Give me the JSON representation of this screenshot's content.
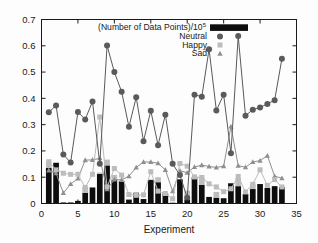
{
  "chart_data": {
    "type": "line",
    "title": "",
    "subtitle": "",
    "xlabel": "Experiment",
    "ylabel": "",
    "xlim": [
      0,
      35
    ],
    "ylim": [
      0,
      0.7
    ],
    "xticks": [
      0,
      5,
      10,
      15,
      20,
      25,
      30,
      35
    ],
    "xtick_labels": [
      "0",
      "5",
      "10",
      "15",
      "20",
      "25",
      "30",
      "35"
    ],
    "yticks": [
      0,
      0.1,
      0.2,
      0.3,
      0.4,
      0.5,
      0.6,
      0.7
    ],
    "ytick_labels": [
      "0",
      "0.1",
      "0.2",
      "0.3",
      "0.4",
      "0.5",
      "0.6",
      "0.7"
    ],
    "grid": false,
    "legend_position": "top-center",
    "x": [
      1,
      2,
      3,
      4,
      5,
      6,
      7,
      8,
      9,
      10,
      11,
      12,
      13,
      14,
      15,
      16,
      17,
      18,
      19,
      20,
      21,
      22,
      23,
      24,
      25,
      26,
      27,
      28,
      29,
      30,
      31,
      32,
      33
    ],
    "series": [
      {
        "name": "(Number of Data Points)/10",
        "name_exponent": "5",
        "type": "bar",
        "marker": "filled-rectangle",
        "color": "#0d0d0d",
        "values": [
          0.135,
          0.155,
          0.004,
          0.004,
          0.01,
          0.04,
          0.061,
          0.113,
          0.145,
          0.09,
          0.086,
          0.015,
          0.041,
          0.017,
          0.09,
          0.081,
          0.038,
          0.003,
          0.092,
          0.016,
          0.1,
          0.071,
          0.025,
          0.022,
          0.02,
          0.077,
          0.066,
          0.036,
          0.055,
          0.074,
          0.059,
          0.066,
          0.062
        ]
      },
      {
        "name": "Neutral",
        "type": "line-marker",
        "marker": "circle",
        "color": "#5a5a5a",
        "values": [
          0.347,
          0.373,
          0.186,
          0.156,
          0.348,
          0.32,
          0.388,
          0.151,
          0.601,
          0.5,
          0.425,
          0.292,
          0.404,
          0.237,
          0.353,
          0.222,
          0.338,
          0.151,
          0.108,
          0.022,
          0.414,
          0.406,
          0.587,
          0.354,
          0.414,
          0.191,
          0.637,
          0.334,
          0.357,
          0.365,
          0.379,
          0.393,
          0.551
        ]
      },
      {
        "name": "Happy",
        "type": "line-marker",
        "marker": "square",
        "color": "#b8b8b8",
        "values": [
          0.159,
          0.128,
          0.115,
          0.111,
          0.111,
          0.061,
          0.111,
          0.329,
          0.063,
          0.133,
          0.108,
          0.034,
          0.031,
          0.033,
          0.121,
          0.047,
          0.038,
          0.018,
          0.152,
          0.142,
          0.101,
          0.099,
          0.075,
          0.063,
          0.045,
          0.056,
          0.103,
          0.044,
          0.073,
          0.128,
          0.069,
          0.091,
          0.063
        ]
      },
      {
        "name": "Sad",
        "type": "line-marker",
        "marker": "triangle",
        "color": "#8c8c8c",
        "values": [
          0.126,
          0.115,
          0.04,
          0.074,
          0.095,
          0.165,
          0.166,
          0.172,
          0.054,
          0.091,
          0.09,
          0.104,
          0.137,
          0.158,
          0.158,
          0.153,
          0.128,
          0.047,
          0.125,
          0.117,
          0.139,
          0.146,
          0.141,
          0.137,
          0.142,
          0.293,
          0.144,
          0.138,
          0.158,
          0.163,
          0.182,
          0.104,
          0.096
        ]
      }
    ],
    "bar_stack_overlay": {
      "description": "light-gray segment atop some black bars",
      "values": [
        0.026,
        0.0,
        0.0,
        0.0,
        0.0,
        0.022,
        0.0,
        0.005,
        0.022,
        0.019,
        0.0,
        0.0,
        0.0,
        0.0,
        0.0,
        0.019,
        0.0,
        0.0,
        0.0,
        0.033,
        0.0,
        0.027,
        0.0,
        0.022,
        0.0,
        0.0,
        0.031,
        0.0,
        0.018,
        0.0,
        0.0,
        0.0,
        0.0
      ]
    }
  },
  "legend": {
    "items": [
      {
        "label": "(Number of Data Points)/10",
        "sup": "5",
        "marker": "filled-rectangle"
      },
      {
        "label": "Neutral",
        "sup": "",
        "marker": "circle"
      },
      {
        "label": "Happy",
        "sup": "",
        "marker": "square"
      },
      {
        "label": "Sad",
        "sup": "",
        "marker": "triangle"
      }
    ]
  },
  "colors": {
    "bars": "#0d0d0d",
    "bars_overlay": "#bdbdbd",
    "neutral": "#5a5a5a",
    "happy": "#bcbcbc",
    "sad": "#8f8f8f",
    "axis": "#1a1a1a",
    "background": "#fdfdfd"
  }
}
